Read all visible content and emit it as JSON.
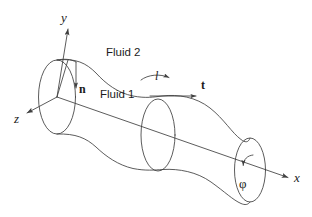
{
  "figure": {
    "kind": "physics-schematic",
    "width": 312,
    "height": 217,
    "background_color": "#ffffff",
    "line_color": "#3f3f3f",
    "text_color": "#1a1a1a"
  },
  "axes": {
    "y": {
      "label": "y",
      "direction": "up"
    },
    "z": {
      "label": "z",
      "direction": "down-left"
    },
    "x": {
      "label": "x",
      "direction": "down-right"
    }
  },
  "vectors": {
    "normal": {
      "label": "n",
      "description": "interface normal, points downward"
    },
    "tangent": {
      "label": "t",
      "description": "interface tangent, points along x"
    },
    "arclength": {
      "label": "l",
      "description": "arclength coordinate along interface"
    }
  },
  "regions": {
    "outer": {
      "label": "Fluid 2"
    },
    "inner": {
      "label": "Fluid 1"
    }
  },
  "angle": {
    "label": "φ",
    "description": "azimuthal angle about the x axis"
  },
  "icons": {
    "y_axis_arrow": "arrow-up-icon",
    "z_axis_arrow": "arrow-down-left-icon",
    "x_axis_arrow": "arrow-down-right-icon",
    "normal_arrow": "arrow-down-icon",
    "tangent_arrow": "arrow-right-icon",
    "arclength_arrow": "curved-arrow-right-icon",
    "phi_arrow": "rotation-arrow-icon"
  }
}
